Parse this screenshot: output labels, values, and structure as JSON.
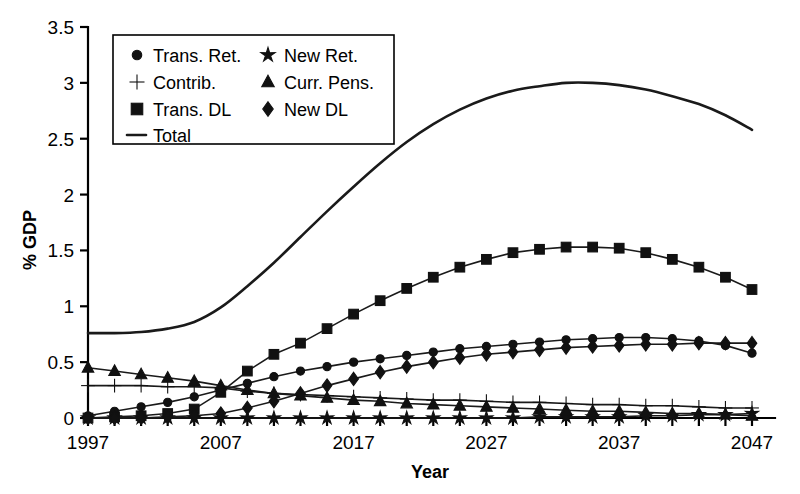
{
  "chart_data": {
    "type": "line",
    "title": "",
    "xlabel": "Year",
    "ylabel": "% GDP",
    "xlim": [
      1997,
      2047
    ],
    "ylim": [
      0,
      3.5
    ],
    "yticks": [
      "0",
      "0.5",
      "1",
      "1.5",
      "2",
      "2.5",
      "3",
      "3.5"
    ],
    "ytick_values": [
      0,
      0.5,
      1,
      1.5,
      2,
      2.5,
      3,
      3.5
    ],
    "xticks": [
      "1997",
      "2007",
      "2017",
      "2027",
      "2037",
      "2047"
    ],
    "xtick_values": [
      1997,
      2007,
      2017,
      2027,
      2037,
      2047
    ],
    "grid": false,
    "legend_position": "upper-left",
    "x": [
      1997,
      1999,
      2001,
      2003,
      2005,
      2007,
      2009,
      2011,
      2013,
      2015,
      2017,
      2019,
      2021,
      2023,
      2025,
      2027,
      2029,
      2031,
      2033,
      2035,
      2037,
      2039,
      2041,
      2043,
      2045,
      2047
    ],
    "series": [
      {
        "name": "Trans. Ret.",
        "marker": "circle",
        "values": [
          0.02,
          0.06,
          0.1,
          0.14,
          0.19,
          0.25,
          0.31,
          0.37,
          0.42,
          0.46,
          0.5,
          0.53,
          0.56,
          0.59,
          0.62,
          0.64,
          0.66,
          0.68,
          0.7,
          0.71,
          0.72,
          0.72,
          0.71,
          0.69,
          0.65,
          0.58
        ]
      },
      {
        "name": "New Ret.",
        "marker": "star",
        "values": [
          0.0,
          0.0,
          0.0,
          0.0,
          0.0,
          0.0,
          0.0,
          0.0,
          0.0,
          0.0,
          0.0,
          0.0,
          0.0,
          0.0,
          0.0,
          0.0,
          0.0,
          0.01,
          0.01,
          0.01,
          0.01,
          0.02,
          0.02,
          0.03,
          0.03,
          0.04
        ]
      },
      {
        "name": "Contrib.",
        "marker": "plus",
        "values": [
          0.29,
          0.29,
          0.29,
          0.28,
          0.28,
          0.27,
          0.24,
          0.22,
          0.21,
          0.2,
          0.19,
          0.18,
          0.17,
          0.16,
          0.16,
          0.15,
          0.14,
          0.14,
          0.13,
          0.12,
          0.12,
          0.11,
          0.11,
          0.1,
          0.09,
          0.09
        ]
      },
      {
        "name": "Curr. Pens.",
        "marker": "triangle",
        "values": [
          0.45,
          0.42,
          0.39,
          0.36,
          0.33,
          0.29,
          0.25,
          0.22,
          0.2,
          0.18,
          0.16,
          0.15,
          0.13,
          0.12,
          0.11,
          0.1,
          0.09,
          0.08,
          0.07,
          0.06,
          0.06,
          0.05,
          0.04,
          0.04,
          0.03,
          0.02
        ]
      },
      {
        "name": "Trans. DL",
        "marker": "square",
        "values": [
          0.0,
          0.01,
          0.02,
          0.04,
          0.08,
          0.23,
          0.42,
          0.57,
          0.67,
          0.8,
          0.93,
          1.05,
          1.16,
          1.26,
          1.35,
          1.42,
          1.48,
          1.51,
          1.53,
          1.53,
          1.52,
          1.48,
          1.42,
          1.35,
          1.26,
          1.15
        ]
      },
      {
        "name": "New  DL",
        "marker": "diamond",
        "values": [
          0.0,
          0.0,
          0.0,
          0.01,
          0.02,
          0.04,
          0.09,
          0.15,
          0.22,
          0.29,
          0.35,
          0.41,
          0.46,
          0.5,
          0.54,
          0.57,
          0.59,
          0.61,
          0.63,
          0.64,
          0.65,
          0.66,
          0.66,
          0.67,
          0.67,
          0.67
        ]
      },
      {
        "name": "Total",
        "marker": "line",
        "values": [
          0.76,
          0.76,
          0.77,
          0.8,
          0.86,
          0.99,
          1.18,
          1.39,
          1.62,
          1.85,
          2.07,
          2.28,
          2.47,
          2.63,
          2.76,
          2.86,
          2.93,
          2.97,
          3.0,
          3.0,
          2.98,
          2.94,
          2.88,
          2.81,
          2.71,
          2.58
        ]
      }
    ]
  },
  "legend": {
    "entries": [
      {
        "label": "Trans. Ret.",
        "marker": "circle"
      },
      {
        "label": "New Ret.",
        "marker": "star"
      },
      {
        "label": "Contrib.",
        "marker": "plus"
      },
      {
        "label": "Curr. Pens.",
        "marker": "triangle"
      },
      {
        "label": "Trans. DL",
        "marker": "square"
      },
      {
        "label": "New  DL",
        "marker": "diamond"
      },
      {
        "label": "Total",
        "marker": "line"
      }
    ]
  },
  "colors": {
    "ink": "#000000",
    "series": "#1a1a1a",
    "background": "#ffffff"
  }
}
